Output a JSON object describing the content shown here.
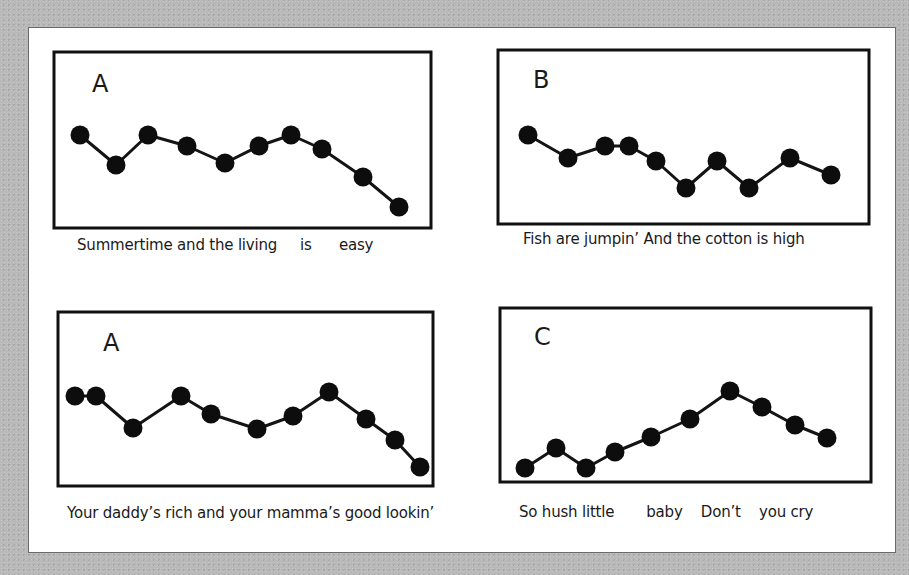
{
  "figure": {
    "panels": [
      {
        "id": "panel-a-1",
        "label": "A",
        "caption": "Summertime and the living     is      easy",
        "box": {
          "x": 54,
          "y": 52,
          "w": 377,
          "h": 176
        },
        "label_pos": {
          "x": 92,
          "y": 92
        },
        "caption_pos": {
          "x": 77,
          "y": 244
        },
        "points": [
          [
            80,
            135
          ],
          [
            116,
            165
          ],
          [
            148,
            135
          ],
          [
            187,
            146
          ],
          [
            225,
            163
          ],
          [
            259,
            146
          ],
          [
            291,
            135
          ],
          [
            322,
            149
          ],
          [
            363,
            177
          ],
          [
            399,
            207
          ]
        ]
      },
      {
        "id": "panel-b",
        "label": "B",
        "caption": "Fish are jumpin’ And the cotton is high",
        "box": {
          "x": 498,
          "y": 50,
          "w": 371,
          "h": 174
        },
        "label_pos": {
          "x": 533,
          "y": 88
        },
        "caption_pos": {
          "x": 523,
          "y": 238
        },
        "points": [
          [
            528,
            135
          ],
          [
            568,
            158
          ],
          [
            605,
            146
          ],
          [
            629,
            146
          ],
          [
            656,
            161
          ],
          [
            686,
            188
          ],
          [
            717,
            161
          ],
          [
            749,
            188
          ],
          [
            790,
            158
          ],
          [
            831,
            175
          ]
        ]
      },
      {
        "id": "panel-a-2",
        "label": "A",
        "caption": "Your daddy’s rich and your mamma’s good lookin’",
        "box": {
          "x": 58,
          "y": 312,
          "w": 375,
          "h": 174
        },
        "label_pos": {
          "x": 103,
          "y": 351
        },
        "caption_pos": {
          "x": 67,
          "y": 512
        },
        "points": [
          [
            75,
            396
          ],
          [
            96,
            396
          ],
          [
            133,
            428
          ],
          [
            181,
            396
          ],
          [
            211,
            414
          ],
          [
            257,
            429
          ],
          [
            293,
            416
          ],
          [
            329,
            392
          ],
          [
            366,
            419
          ],
          [
            395,
            440
          ],
          [
            420,
            467
          ]
        ]
      },
      {
        "id": "panel-c",
        "label": "C",
        "caption": "So hush little       baby    Don’t    you cry",
        "box": {
          "x": 500,
          "y": 308,
          "w": 371,
          "h": 174
        },
        "label_pos": {
          "x": 534,
          "y": 345
        },
        "caption_pos": {
          "x": 519,
          "y": 511
        },
        "points": [
          [
            525,
            468
          ],
          [
            556,
            448
          ],
          [
            586,
            468
          ],
          [
            615,
            452
          ],
          [
            651,
            437
          ],
          [
            690,
            419
          ],
          [
            730,
            391
          ],
          [
            762,
            407
          ],
          [
            795,
            425
          ],
          [
            827,
            438
          ]
        ]
      }
    ],
    "style": {
      "dot_color": "#0d0d0d",
      "line_color": "#141414",
      "box_color": "#111111",
      "dot_radius": 9.5,
      "line_width": 3,
      "box_width": 3
    }
  },
  "chart_data": [
    {
      "type": "line",
      "title": "A",
      "caption": "Summertime and the living is easy",
      "x": [
        1,
        2,
        3,
        4,
        5,
        6,
        7,
        8,
        9,
        10
      ],
      "values": [
        7.2,
        5.8,
        7.2,
        6.7,
        5.9,
        6.7,
        7.2,
        6.5,
        5.2,
        3.8
      ],
      "xlabel": "",
      "ylabel": "pitch (relative)",
      "grid": false
    },
    {
      "type": "line",
      "title": "B",
      "caption": "Fish are jumpin' And the cotton is high",
      "x": [
        1,
        2,
        3,
        4,
        5,
        6,
        7,
        8,
        9,
        10
      ],
      "values": [
        7.2,
        6.1,
        6.7,
        6.7,
        6.0,
        4.7,
        6.0,
        4.7,
        6.1,
        5.3
      ],
      "xlabel": "",
      "ylabel": "pitch (relative)",
      "grid": false
    },
    {
      "type": "line",
      "title": "A",
      "caption": "Your daddy's rich and your mamma's good lookin'",
      "x": [
        1,
        2,
        3,
        4,
        5,
        6,
        7,
        8,
        9,
        10,
        11
      ],
      "values": [
        7.1,
        7.1,
        5.6,
        7.1,
        6.3,
        5.6,
        6.2,
        7.3,
        6.0,
        5.1,
        3.8
      ],
      "xlabel": "",
      "ylabel": "pitch (relative)",
      "grid": false
    },
    {
      "type": "line",
      "title": "C",
      "caption": "So hush little baby Don't you cry",
      "x": [
        1,
        2,
        3,
        4,
        5,
        6,
        7,
        8,
        9,
        10
      ],
      "values": [
        3.2,
        4.2,
        3.2,
        3.9,
        4.6,
        5.5,
        6.8,
        6.1,
        5.2,
        4.6
      ],
      "xlabel": "",
      "ylabel": "pitch (relative)",
      "grid": false
    }
  ]
}
